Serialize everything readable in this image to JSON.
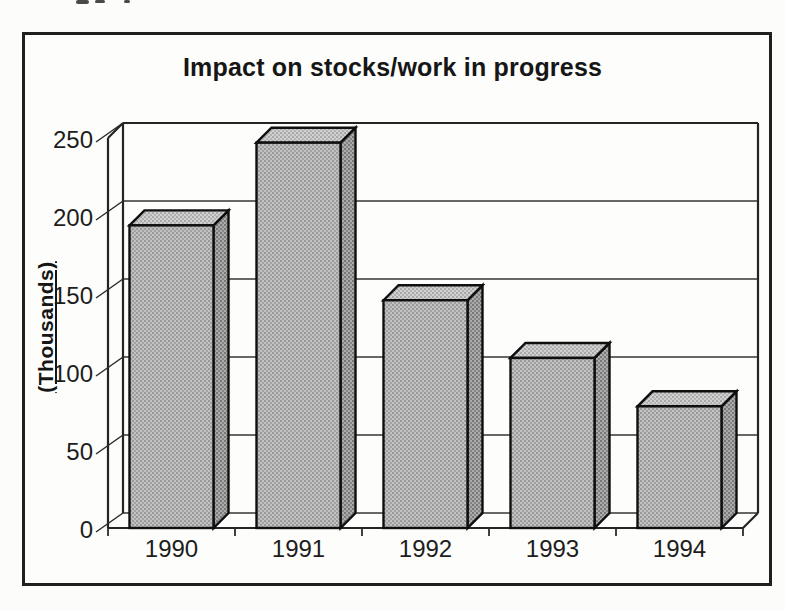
{
  "chart_data": {
    "type": "bar",
    "variant": "3d-column",
    "title": "Impact on stocks/work in progress",
    "ylabel": "(Thousands)",
    "categories": [
      "1990",
      "1991",
      "1992",
      "1993",
      "1994"
    ],
    "values": [
      194,
      247,
      146,
      109,
      78
    ],
    "yticks": [
      0,
      50,
      100,
      150,
      200,
      250
    ],
    "ylim": [
      0,
      250
    ],
    "grid": true,
    "legend": false,
    "bar_color": "#b0b0b0",
    "bar_top_color": "#c6c6c6",
    "bar_side_color": "#979797",
    "outline_color": "#0f0f0f"
  }
}
